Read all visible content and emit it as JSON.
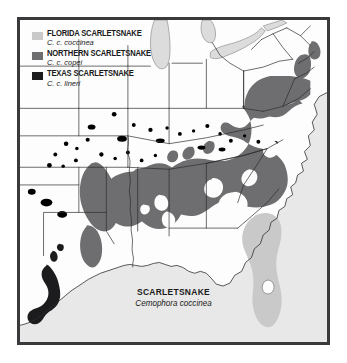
{
  "figure": {
    "type": "range-distribution-map",
    "frame_border_color": "#3a3a3c",
    "background_color": "#ffffff"
  },
  "legend": {
    "items": [
      {
        "swatch_name": "legend-swatch-florida",
        "color": "#c9c9c9",
        "common_name": "FLORIDA SCARLETSNAKE",
        "scientific_name": "C. c. coccinea"
      },
      {
        "swatch_name": "legend-swatch-northern",
        "color": "#6e6e70",
        "common_name": "NORTHERN SCARLETSNAKE",
        "scientific_name": "C. c. copei"
      },
      {
        "swatch_name": "legend-swatch-texas",
        "color": "#1c1c1e",
        "common_name": "TEXAS SCARLETSNAKE",
        "scientific_name": "C. c. lineri"
      }
    ]
  },
  "caption": {
    "common_name": "SCARLETSNAKE",
    "scientific_name": "Cemophora coccinea"
  },
  "map": {
    "land_color": "#fdfdfd",
    "water_color": "#e8e8e8",
    "lake_color": "#dcdcdc",
    "state_border_color": "#2b2b2b",
    "coast_line_color": "#2b2b2b",
    "range_florida_color": "#c9c9c9",
    "range_northern_color": "#6e6e70",
    "range_texas_color": "#1c1c1e",
    "region": "Eastern and south-central United States",
    "features": [
      "Great Lakes (Michigan, Erie, Ontario) shown as light gray water",
      "Atlantic Ocean and Gulf of Mexico shown as light gray water",
      "Florida peninsula filled light gray for Florida Scarletsnake",
      "Broad dark-gray band across the Southeast for Northern Scarletsnake",
      "Black coastal strip in south Texas for Texas Scarletsnake",
      "Scattered isolated dot populations in Oklahoma, Kansas, Missouri and Tennessee",
      "White unoccupied enclaves within Georgia, Alabama, Mississippi and the Carolinas"
    ]
  }
}
